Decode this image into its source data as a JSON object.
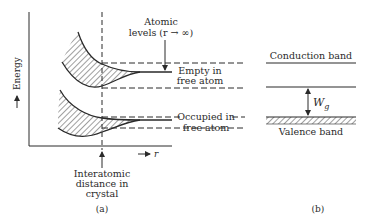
{
  "panel_a": {
    "y_axis_label": "Energy",
    "x_axis_label": "r",
    "atomic_levels_line1": "Atomic",
    "atomic_levels_line2": "levels (r → ∞)",
    "empty_line1": "Empty in",
    "empty_line2": "free atom",
    "occupied_line1": "Occupied in",
    "occupied_line2": "free atom",
    "interatomic_line1": "Interatomic",
    "interatomic_line2": "distance in",
    "interatomic_line3": "crystal",
    "caption": "(a)"
  },
  "panel_b": {
    "conduction_label": "Conduction band",
    "valence_label": "Valence band",
    "gap_label": "W",
    "gap_subscript": "g",
    "caption": "(b)"
  },
  "colors": {
    "ink": "#2a2a2a",
    "background": "#ffffff"
  }
}
